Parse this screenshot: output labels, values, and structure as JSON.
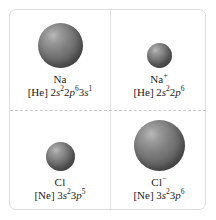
{
  "figure": {
    "colors": {
      "sphere": "#6a6a6a",
      "panel_border": "#dddddd",
      "divider_solid": "#e2e2e2",
      "divider_dashed": "#c9c9c9",
      "background": "#ffffff",
      "text": "#1c1c1c"
    },
    "dividers": {
      "vertical": "solid",
      "horizontal": "dashed"
    }
  },
  "cells": [
    {
      "position": "top-left",
      "species_label": "Na",
      "charge": "",
      "core": "[He]",
      "config_plain": "2s22p63s1",
      "config_parts": [
        {
          "n": "2",
          "orbital": "s",
          "electrons": "2"
        },
        {
          "n": "2",
          "orbital": "p",
          "electrons": "6"
        },
        {
          "n": "3",
          "orbital": "s",
          "electrons": "1"
        }
      ],
      "sphere_diameter_px": 45
    },
    {
      "position": "top-right",
      "species_label": "Na",
      "charge": "+",
      "core": "[He]",
      "config_plain": "2s22p6",
      "config_parts": [
        {
          "n": "2",
          "orbital": "s",
          "electrons": "2"
        },
        {
          "n": "2",
          "orbital": "p",
          "electrons": "6"
        }
      ],
      "sphere_diameter_px": 25
    },
    {
      "position": "bottom-left",
      "species_label": "Cl",
      "charge": "",
      "core": "[Ne]",
      "config_plain": "3s23p5",
      "config_parts": [
        {
          "n": "3",
          "orbital": "s",
          "electrons": "2"
        },
        {
          "n": "3",
          "orbital": "p",
          "electrons": "5"
        }
      ],
      "sphere_diameter_px": 29
    },
    {
      "position": "bottom-right",
      "species_label": "Cl",
      "charge": "−",
      "core": "[Ne]",
      "config_plain": "3s23p6",
      "config_parts": [
        {
          "n": "3",
          "orbital": "s",
          "electrons": "2"
        },
        {
          "n": "3",
          "orbital": "p",
          "electrons": "6"
        }
      ],
      "sphere_diameter_px": 51
    }
  ]
}
